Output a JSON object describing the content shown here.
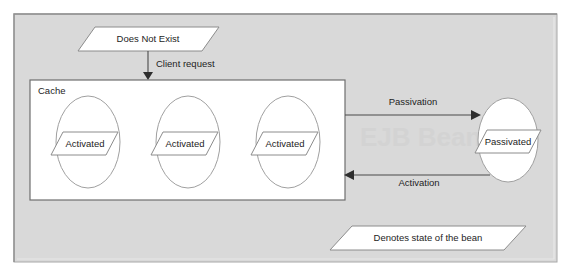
{
  "figure": {
    "type": "state-diagram",
    "canvas": {
      "width": 572,
      "height": 276
    },
    "colors": {
      "page_background": "#ffffff",
      "frame_background": "#d9d9d9",
      "frame_border": "#9a9a9a",
      "frame_highlight": "#f2f2f2",
      "panel_fill": "#ffffff",
      "panel_border": "#6e6e6e",
      "shape_fill": "#ffffff",
      "shape_stroke": "#8c8c8c",
      "ellipse_stroke": "#a0a0a0",
      "arrow_stroke": "#4a4a4a",
      "text": "#1d1d1d",
      "watermark": "#cfcfcf"
    },
    "frame": {
      "x": 14,
      "y": 14,
      "width": 543,
      "height": 248
    },
    "watermark": {
      "text": "EJB Bean",
      "x": 360,
      "y": 142
    }
  },
  "nodes": {
    "does_not_exist": {
      "label": "Does Not Exist",
      "shape": "parallelogram",
      "x": 78,
      "y": 27,
      "width": 140,
      "height": 24,
      "skew": 16
    },
    "cache_group": {
      "label": "Cache",
      "shape": "rectangle",
      "x": 30,
      "y": 80,
      "width": 315,
      "height": 120
    },
    "passivated": {
      "label": "Passivated",
      "shape": "ellipse-with-parallelogram",
      "cx": 508,
      "cy": 140,
      "rx": 30,
      "ry": 42
    },
    "legend": {
      "label": "Denotes state of the bean",
      "shape": "parallelogram",
      "x": 330,
      "y": 226,
      "width": 196,
      "height": 24,
      "skew": 22
    }
  },
  "cache_states": [
    {
      "label": "Activated",
      "cx": 88,
      "cy": 142,
      "rx": 32,
      "ry": 46
    },
    {
      "label": "Activated",
      "cx": 188,
      "cy": 142,
      "rx": 32,
      "ry": 46
    },
    {
      "label": "Activated",
      "cx": 288,
      "cy": 142,
      "rx": 32,
      "ry": 46
    }
  ],
  "edges": [
    {
      "id": "client-request",
      "label": "Client request",
      "from": "does_not_exist",
      "to": "cache_group",
      "direction": "down",
      "label_x": 156,
      "label_y": 66
    },
    {
      "id": "passivation",
      "label": "Passivation",
      "from": "cache_group",
      "to": "passivated",
      "direction": "right",
      "label_x": 415,
      "label_y": 105
    },
    {
      "id": "activation",
      "label": "Activation",
      "from": "passivated",
      "to": "cache_group",
      "direction": "left",
      "label_x": 418,
      "label_y": 186
    }
  ]
}
